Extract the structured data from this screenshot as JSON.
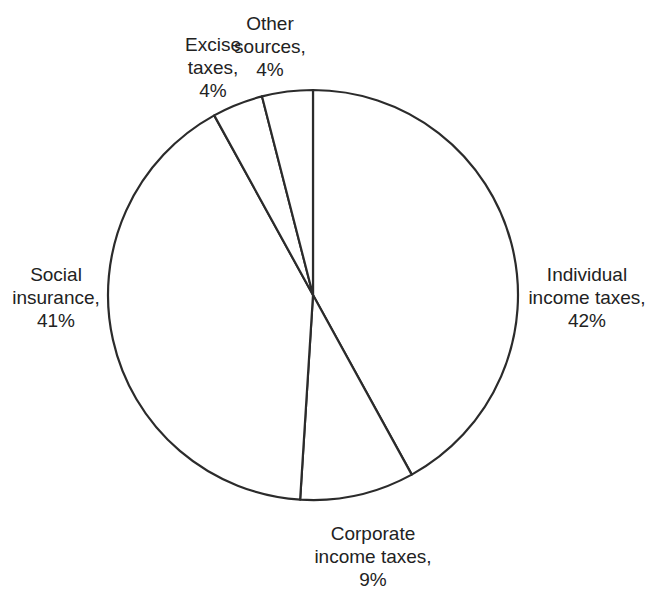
{
  "chart_data": {
    "type": "pie",
    "title": "",
    "start_angle": "12 o'clock",
    "direction": "clockwise",
    "slices": [
      {
        "name": "Individual income taxes",
        "value": 42,
        "label_lines": [
          "Individual",
          "income taxes,",
          "42%"
        ]
      },
      {
        "name": "Corporate income taxes",
        "value": 9,
        "label_lines": [
          "Corporate",
          "income taxes,",
          "9%"
        ]
      },
      {
        "name": "Social insurance",
        "value": 41,
        "label_lines": [
          "Social",
          "insurance,",
          "41%"
        ]
      },
      {
        "name": "Excise taxes",
        "value": 4,
        "label_lines": [
          "Excise",
          "taxes,",
          "4%"
        ]
      },
      {
        "name": "Other sources",
        "value": 4,
        "label_lines": [
          "Other",
          "sources,",
          "4%"
        ]
      }
    ],
    "unit": "%",
    "fill": "#ffffff",
    "stroke": "#2b2b2b"
  }
}
